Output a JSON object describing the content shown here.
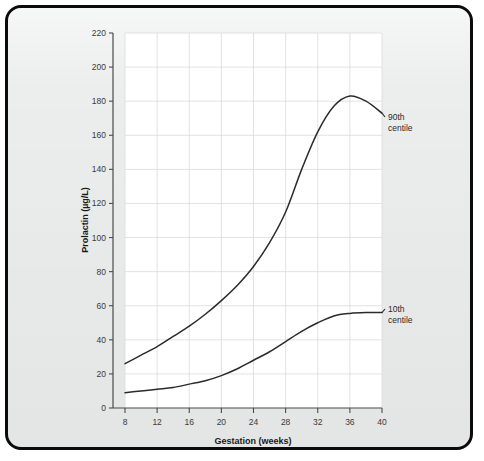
{
  "figure": {
    "border_color": "#0b0b0b",
    "page_background": "#eceded",
    "plot_background": "#ffffff",
    "grid_color": "#d8dade",
    "axis_color": "#4a4a4a",
    "curve_color": "#2b2b2b"
  },
  "chart_data": {
    "type": "line",
    "title": "",
    "subtitle": "",
    "xlabel": "Gestation (weeks)",
    "ylabel": "Prolactin (µg/L)",
    "xlim": [
      8,
      40
    ],
    "ylim": [
      0,
      220
    ],
    "xticks": [
      8,
      12,
      16,
      20,
      24,
      28,
      32,
      36,
      40
    ],
    "xtick_labels": [
      "8",
      "12",
      "16",
      "20",
      "24",
      "28",
      "32",
      "36",
      "40"
    ],
    "yticks": [
      0,
      20,
      40,
      60,
      80,
      100,
      120,
      140,
      160,
      180,
      200,
      220
    ],
    "ytick_labels": [
      "0",
      "20",
      "40",
      "60",
      "80",
      "100",
      "120",
      "140",
      "160",
      "180",
      "200",
      "220"
    ],
    "grid": true,
    "grid_axis": "both",
    "legend": "inline-right-annotations",
    "x": [
      8,
      10,
      12,
      14,
      16,
      18,
      20,
      22,
      24,
      26,
      28,
      30,
      32,
      34,
      36,
      38,
      40
    ],
    "series": [
      {
        "name": "90th centile",
        "label": "90th\ncentile",
        "label_line1": "90th",
        "label_line2": "centile",
        "values": [
          26,
          31,
          36,
          42,
          48,
          55,
          63,
          72,
          83,
          97,
          115,
          140,
          162,
          177,
          183,
          180,
          173
        ]
      },
      {
        "name": "10th centile",
        "label": "10th\ncentile",
        "label_line1": "10th",
        "label_line2": "centile",
        "values": [
          9,
          10,
          11,
          12,
          14,
          16,
          19,
          23,
          28,
          33,
          39,
          45,
          50,
          54,
          55.5,
          56,
          56
        ]
      }
    ],
    "annotations": [
      {
        "text": "90th centile",
        "x": 40,
        "y": 176,
        "leader": true
      },
      {
        "text": "10th centile",
        "x": 40,
        "y": 56,
        "leader": true
      }
    ]
  },
  "axes": {
    "y_title": "Prolactin (µg/L)",
    "x_title": "Gestation (weeks)"
  }
}
